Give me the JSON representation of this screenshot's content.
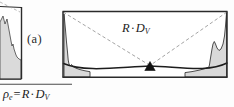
{
  "figure": {
    "panel_label": "(a)",
    "center_label": {
      "symbol_r": "R",
      "operator": "·",
      "symbol_d": "D",
      "subscript": "V"
    },
    "formula": {
      "rho": "ρ",
      "rho_sub": "e",
      "equals": "=",
      "symbol_r": "R",
      "operator": "·",
      "symbol_d": "D",
      "subscript": "V"
    },
    "colors": {
      "ink": "#1a1a1a",
      "frame": "#2b2b2b",
      "dashed": "#8a8a8a",
      "shade_fill": "#d8d8d8",
      "marker": "#111111",
      "rule": "#4a4a4a",
      "page": "#fdfdfd"
    },
    "elements": {
      "main_frame": "rectangular-plot-frame",
      "diagonals": "dashed-diagonal-lines",
      "convergence_marker": "filled-triangle-marker",
      "arc": "curved-baseline-arc",
      "left_peak": "left-edge-shaded-histogram-peak",
      "right_peak": "right-edge-shaded-histogram-peak",
      "partial_panel": "cropped-left-panel",
      "divider": "horizontal-rule"
    },
    "geometry": {
      "main_frame_box": [
        62,
        11,
        228,
        77
      ],
      "partial_frame_box": [
        0,
        6,
        28,
        80
      ],
      "marker_point": [
        150,
        66
      ],
      "rule_y": 84,
      "rule_x_end": 72
    }
  }
}
